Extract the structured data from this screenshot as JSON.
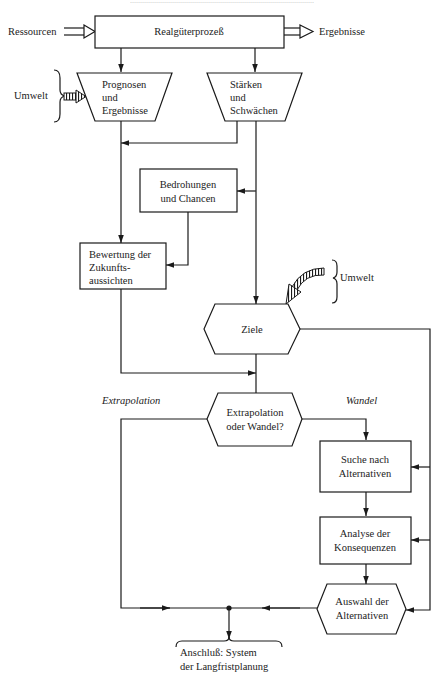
{
  "header": {
    "cut_off_text": "............................................................................................"
  },
  "top": {
    "input_label": "Ressourcen",
    "process_label": "Realgüterprozeß",
    "output_label": "Ergebnisse"
  },
  "left_env": {
    "label": "Umwelt"
  },
  "prognosen": {
    "line1": "Prognosen",
    "line2": "und",
    "line3": "Ergebnisse"
  },
  "staerken": {
    "line1": "Stärken",
    "line2": "und",
    "line3": "Schwächen"
  },
  "bedrohungen": {
    "line1": "Bedrohungen",
    "line2": "und Chancen"
  },
  "bewertung": {
    "line1": "Bewertung der",
    "line2": "Zukunfts-",
    "line3": "aussichten"
  },
  "right_env": {
    "label": "Umwelt"
  },
  "ziele": {
    "label": "Ziele"
  },
  "branch_labels": {
    "left": "Extrapolation",
    "right": "Wandel"
  },
  "decision": {
    "line1": "Extrapolation",
    "line2": "oder Wandel?"
  },
  "suche": {
    "line1": "Suche nach",
    "line2": "Alternativen"
  },
  "analyse": {
    "line1": "Analyse der",
    "line2": "Konsequenzen"
  },
  "auswahl": {
    "line1": "Auswahl der",
    "line2": "Alternativen"
  },
  "output": {
    "line1": "Anschluß: System",
    "line2": "der Langfristplanung"
  },
  "colors": {
    "ink": "#1a1a1a",
    "paper": "#ffffff"
  }
}
